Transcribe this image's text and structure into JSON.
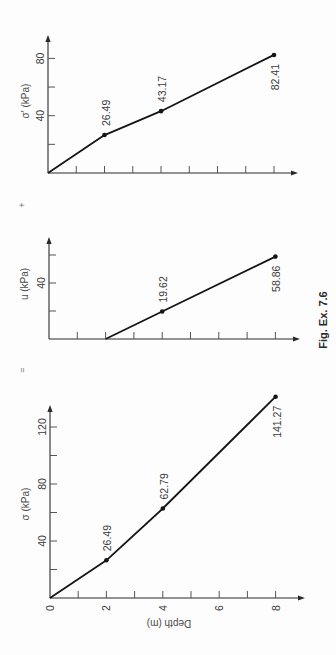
{
  "figure": {
    "caption": "Fig. Ex. 7.6",
    "operators": {
      "equals": "=",
      "plus": "+"
    },
    "orientation": "rotated 90° counter-clockwise",
    "colors": {
      "line": "#151515",
      "axis": "#2a2a2a",
      "text": "#3a3a3a",
      "background": "#fdfdfd"
    }
  },
  "chart_data": [
    {
      "type": "line",
      "title": "Total stress",
      "xlabel": "Depth (m)",
      "ylabel": "σ (kPa)",
      "x": [
        0,
        2,
        4,
        8
      ],
      "y": [
        0,
        26.49,
        62.79,
        141.27
      ],
      "point_labels": [
        "",
        "26.49",
        "62.79",
        "141.27"
      ],
      "label_side": [
        "",
        "above",
        "above",
        "below"
      ],
      "xticks": [
        0,
        1,
        2,
        3,
        4,
        5,
        6,
        7,
        8
      ],
      "xtick_labels": [
        "0",
        "2",
        "4",
        "6",
        "8"
      ],
      "yticks": [
        20,
        40,
        60,
        80,
        100,
        120
      ],
      "ytick_labels": [
        "40",
        "80",
        "120"
      ],
      "xlim": [
        0,
        9
      ],
      "ylim": [
        0,
        135
      ],
      "grid": false
    },
    {
      "type": "line",
      "title": "Pore water pressure",
      "xlabel": "",
      "ylabel": "u (kPa)",
      "x": [
        2,
        4,
        8
      ],
      "y": [
        0,
        19.62,
        58.86
      ],
      "point_labels": [
        "",
        "19.62",
        "58.86"
      ],
      "label_side": [
        "",
        "above",
        "below"
      ],
      "xticks": [
        1,
        2,
        3,
        4,
        5,
        6,
        7,
        8
      ],
      "xtick_labels": [],
      "yticks": [
        20,
        40,
        60
      ],
      "ytick_labels": [
        "40"
      ],
      "xlim": [
        0,
        9
      ],
      "ylim": [
        0,
        72
      ],
      "grid": false
    },
    {
      "type": "line",
      "title": "Effective stress",
      "xlabel": "",
      "ylabel": "σ' (kPa)",
      "x": [
        0,
        2,
        4,
        8
      ],
      "y": [
        0,
        26.49,
        43.17,
        82.41
      ],
      "point_labels": [
        "",
        "26.49",
        "43.17",
        "82.41"
      ],
      "label_side": [
        "",
        "above",
        "above",
        "below"
      ],
      "xticks": [
        1,
        2,
        3,
        4,
        5,
        6,
        7,
        8
      ],
      "xtick_labels": [],
      "yticks": [
        20,
        40,
        60,
        80
      ],
      "ytick_labels": [
        "40",
        "80"
      ],
      "xlim": [
        0,
        9
      ],
      "ylim": [
        0,
        96
      ],
      "grid": false
    }
  ]
}
